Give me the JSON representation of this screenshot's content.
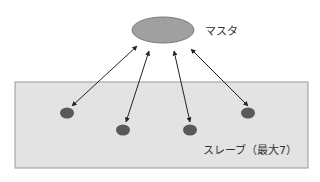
{
  "diagram": {
    "master": {
      "label": "マスタ",
      "cx": 163,
      "cy": 30,
      "rx": 31,
      "ry": 13,
      "fill": "#a0a0a0",
      "stroke": "#7a7a7a"
    },
    "slave_area": {
      "label": "スレーブ（最大7）",
      "x": 15,
      "y": 82,
      "width": 293,
      "height": 86,
      "fill": "#e3e3e3",
      "stroke": "#9a9a9a"
    },
    "slaves": [
      {
        "cx": 67,
        "cy": 113
      },
      {
        "cx": 123,
        "cy": 130
      },
      {
        "cx": 190,
        "cy": 130
      },
      {
        "cx": 248,
        "cy": 113
      }
    ],
    "slave_style": {
      "rx": 7,
      "ry": 5.5,
      "fill": "#595959"
    },
    "links": [
      {
        "x1": 137,
        "y1": 46,
        "x2": 72,
        "y2": 106
      },
      {
        "x1": 149,
        "y1": 51,
        "x2": 126,
        "y2": 122
      },
      {
        "x1": 174,
        "y1": 51,
        "x2": 190,
        "y2": 122
      },
      {
        "x1": 191,
        "y1": 49,
        "x2": 248,
        "y2": 106
      }
    ],
    "link_color": "#222222"
  }
}
